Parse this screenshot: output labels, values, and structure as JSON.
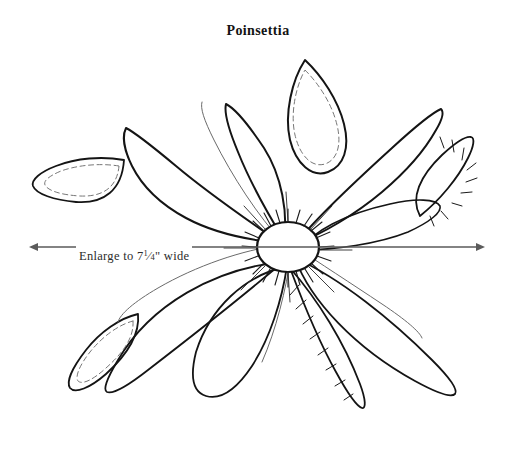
{
  "document": {
    "title": "Poinsettia",
    "type": "craft pattern template",
    "background_color": "#ffffff"
  },
  "annotation": {
    "dimension_label_prefix": "Enlarge to 7",
    "dimension_fraction_numerator": "1",
    "dimension_fraction_denominator": "4",
    "dimension_label_suffix": "\" wide",
    "dimension_label_full": "Enlarge to 7¼\" wide",
    "arrow_color": "#5b5b5b",
    "arrow_left_x": 38,
    "arrow_right_x": 476,
    "arrow_y": 247
  },
  "colors": {
    "outline_dark": "#141414",
    "outline_light": "#4a4a4a",
    "dashed_seam": "#777777",
    "stamen": "#1a1a1a",
    "hatch": "#1a1a1a",
    "text": "#131313"
  },
  "flower": {
    "center": {
      "cx": 288,
      "cy": 247,
      "rx": 31,
      "ry": 25,
      "stamen_count": 26
    },
    "petals": [
      {
        "name": "upper-left-small-leaf",
        "style": "dashed-seam"
      },
      {
        "name": "upper-left-large",
        "style": "plain"
      },
      {
        "name": "upper-middle-left-large",
        "style": "plain"
      },
      {
        "name": "top-center-pointed",
        "style": "dashed-seam"
      },
      {
        "name": "upper-right-large",
        "style": "plain"
      },
      {
        "name": "right-hatched-leaf",
        "style": "hatched"
      },
      {
        "name": "lower-right-large",
        "style": "plain"
      },
      {
        "name": "bottom-right-hatched",
        "style": "hatched"
      },
      {
        "name": "bottom-center-large",
        "style": "plain"
      },
      {
        "name": "lower-left-large",
        "style": "plain"
      },
      {
        "name": "lower-left-small-leaf",
        "style": "dashed-seam"
      }
    ]
  }
}
